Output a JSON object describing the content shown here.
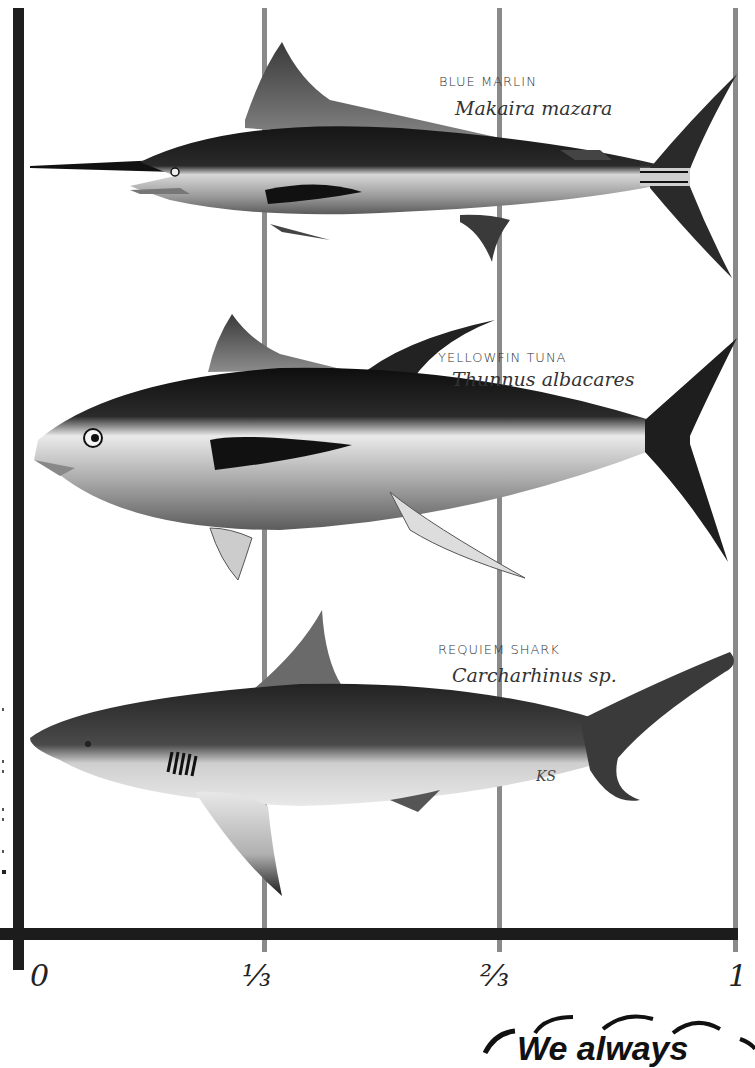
{
  "diagram": {
    "type": "fractional length scale",
    "scale_ticks": [
      {
        "label": "0",
        "position": 0
      },
      {
        "label": "⅓",
        "position": 0.3333
      },
      {
        "label": "⅔",
        "position": 0.6667
      },
      {
        "label": "1",
        "position": 1
      }
    ],
    "line_colors": {
      "axis": "#1c1c1c",
      "gridline": "#8a8a8a"
    }
  },
  "species": [
    {
      "common_name": "BLUE MARLIN",
      "scientific_name": "Makaira mazara"
    },
    {
      "common_name": "YELLOWFIN TUNA",
      "scientific_name": "Thunnus albacares"
    },
    {
      "common_name": "REQUIEM SHARK",
      "scientific_name": "Carcharhinus sp."
    }
  ],
  "artist_signature": "KS",
  "footer": {
    "partial_text": "We always"
  }
}
